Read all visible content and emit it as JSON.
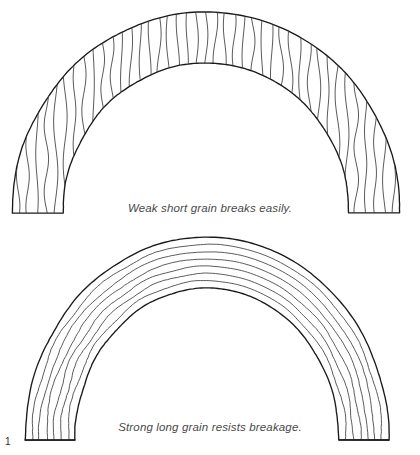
{
  "figure": {
    "number": "1",
    "captions": {
      "weak": "Weak short grain breaks easily.",
      "strong": "Strong long grain resists breakage."
    }
  },
  "colors": {
    "outline": "#1a1a1a",
    "grain": "#3d3d3d",
    "caption_text": "#4a4a4a",
    "background": "#ffffff"
  },
  "diagram_data": {
    "type": "technical-illustration",
    "subject": "wood grain orientation in curved arch members",
    "panels": [
      {
        "id": "top-arch",
        "label": "weak-short-grain-arch",
        "grain_direction": "vertical",
        "grain_line_count": 41,
        "description": "Semicircular arch with straight vertical grain lines that cut across the curve, producing short grain.",
        "geometry": {
          "center_x": 206,
          "base_y": 213,
          "outer_radius_x": 194,
          "outer_radius_y": 201,
          "inner_radius_x": 143,
          "inner_radius_y": 150
        }
      },
      {
        "id": "bottom-arch",
        "label": "strong-long-grain-arch",
        "grain_direction": "concentric",
        "grain_line_count": 6,
        "description": "Semicircular arch with grain lines following the curvature of the arch, producing continuous long grain.",
        "geometry": {
          "center_x": 207,
          "base_y": 440,
          "outer_radius_x": 182,
          "outer_radius_y": 203,
          "inner_radius_x": 132,
          "inner_radius_y": 152
        }
      }
    ]
  }
}
